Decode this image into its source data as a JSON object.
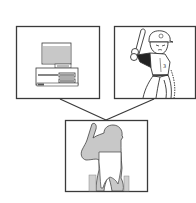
{
  "diagram": {
    "panels": [
      {
        "id": "background-source",
        "content": "computer-equipment"
      },
      {
        "id": "foreground-source",
        "content": "baseball-batter"
      },
      {
        "id": "composite-result",
        "content": "batter-silhouette-over-background"
      }
    ],
    "colors": {
      "stroke": "#3a3a3a",
      "fill_gray": "#c8c8c8",
      "fill_dark": "#222222",
      "background": "#ffffff"
    }
  }
}
